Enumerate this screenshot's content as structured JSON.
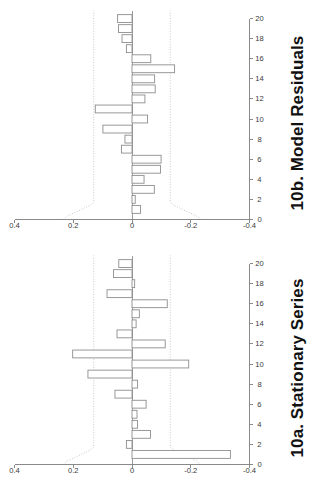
{
  "figure": {
    "background": "#ffffff",
    "bar_fill": "#ffffff",
    "bar_stroke": "#8e8e8e",
    "axis_color": "#8a8a8a",
    "ci_color": "#c2c2c2"
  },
  "panels": [
    {
      "id": "b",
      "title": "10b. Model Residuals"
    },
    {
      "id": "a",
      "title": "10a. Stationary Series"
    }
  ],
  "chart_data": [
    {
      "type": "bar",
      "title": "10a. Stationary Series",
      "xlabel": "",
      "ylabel": "",
      "xlim": [
        0,
        20.8
      ],
      "ylim": [
        -0.4,
        0.4
      ],
      "grid": false,
      "legend": null,
      "orientation": "horizontal-rotated-90ccw",
      "xticks": [
        0,
        2,
        4,
        6,
        8,
        10,
        12,
        14,
        16,
        18,
        20
      ],
      "xticklabels": [
        "0",
        "2",
        "4",
        "6",
        "8",
        "10",
        "12",
        "14",
        "16",
        "18",
        "20"
      ],
      "yticks": [
        -0.4,
        -0.2,
        0,
        0.2,
        0.4
      ],
      "yticklabels": [
        "-0.4",
        "-0.2",
        "0",
        "0.2",
        "0.4"
      ],
      "confidence_band": 0.13,
      "x": [
        1,
        2,
        3,
        4,
        5,
        6,
        7,
        8,
        9,
        10,
        11,
        12,
        13,
        14,
        15,
        16,
        17,
        18,
        19,
        20
      ],
      "categories": [
        "1",
        "2",
        "3",
        "4",
        "5",
        "6",
        "7",
        "8",
        "9",
        "10",
        "11",
        "12",
        "13",
        "14",
        "15",
        "16",
        "17",
        "18",
        "19",
        "20"
      ],
      "values": [
        -0.335,
        0.019,
        -0.063,
        -0.019,
        -0.017,
        -0.048,
        0.058,
        -0.019,
        0.15,
        -0.193,
        0.202,
        -0.113,
        0.051,
        -0.014,
        -0.025,
        -0.12,
        0.085,
        -0.009,
        0.063,
        0.045
      ]
    },
    {
      "type": "bar",
      "title": "10b. Model Residuals",
      "xlabel": "",
      "ylabel": "",
      "xlim": [
        0,
        20.8
      ],
      "ylim": [
        -0.4,
        0.4
      ],
      "grid": false,
      "legend": null,
      "orientation": "horizontal-rotated-90ccw",
      "xticks": [
        0,
        2,
        4,
        6,
        8,
        10,
        12,
        14,
        16,
        18,
        20
      ],
      "xticklabels": [
        "0",
        "2",
        "4",
        "6",
        "8",
        "10",
        "12",
        "14",
        "16",
        "18",
        "20"
      ],
      "yticks": [
        -0.4,
        -0.2,
        0,
        0.2,
        0.4
      ],
      "yticklabels": [
        "-0.4",
        "-0.2",
        "0",
        "0.2",
        "0.4"
      ],
      "confidence_band": 0.13,
      "x": [
        1,
        2,
        3,
        4,
        5,
        6,
        7,
        8,
        9,
        10,
        11,
        12,
        13,
        14,
        15,
        16,
        17,
        18,
        19,
        20
      ],
      "categories": [
        "1",
        "2",
        "3",
        "4",
        "5",
        "6",
        "7",
        "8",
        "9",
        "10",
        "11",
        "12",
        "13",
        "14",
        "15",
        "16",
        "17",
        "18",
        "19",
        "20"
      ],
      "values": [
        -0.029,
        -0.011,
        -0.076,
        -0.041,
        -0.097,
        -0.099,
        0.036,
        0.024,
        0.099,
        -0.053,
        0.125,
        -0.044,
        -0.079,
        -0.077,
        -0.145,
        -0.064,
        0.019,
        0.034,
        0.046,
        0.049
      ]
    }
  ]
}
